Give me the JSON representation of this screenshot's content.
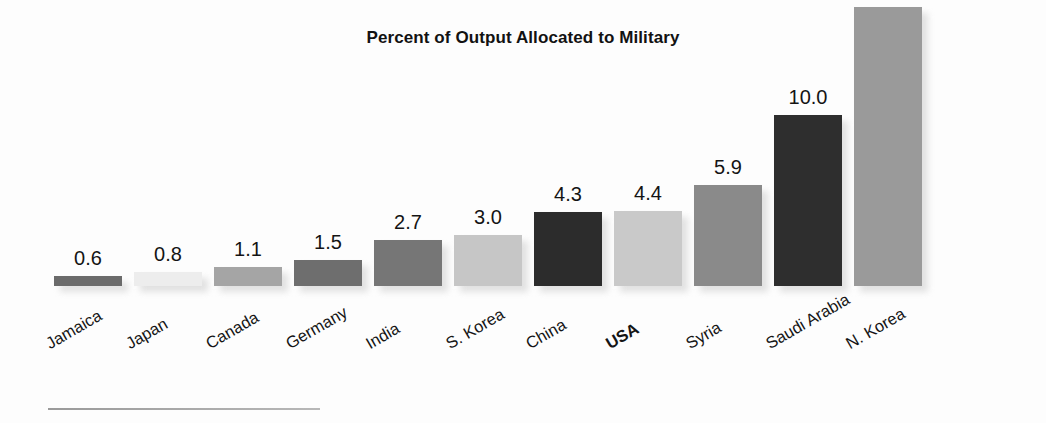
{
  "chart_data": {
    "type": "bar",
    "title": "Percent of Output Allocated to Military",
    "xlabel": "",
    "ylabel": "",
    "ylim": [
      0,
      17.5
    ],
    "grid": false,
    "legend": null,
    "categories": [
      "Jamaica",
      "Japan",
      "Canada",
      "Germany",
      "India",
      "S. Korea",
      "China",
      "USA",
      "Syria",
      "Saudi Arabia",
      "N. Korea"
    ],
    "values": [
      0.6,
      0.8,
      1.1,
      1.5,
      2.7,
      3.0,
      4.3,
      4.4,
      5.9,
      10.0,
      16.3
    ],
    "value_labels": [
      "0.6",
      "0.8",
      "1.1",
      "1.5",
      "2.7",
      "3.0",
      "4.3",
      "4.4",
      "5.9",
      "10.0",
      "16.3"
    ],
    "bar_colors": [
      "#6b6b6b",
      "#ededed",
      "#a5a5a5",
      "#6e6e6e",
      "#767676",
      "#c6c6c6",
      "#2c2c2c",
      "#c9c9c9",
      "#8a8a8a",
      "#2e2e2e",
      "#9a9a9a"
    ],
    "highlighted_category": "USA",
    "bars": [
      {
        "label": "Jamaica",
        "value": 0.6,
        "value_label": "0.6",
        "color": "#6b6b6b",
        "bold": false
      },
      {
        "label": "Japan",
        "value": 0.8,
        "value_label": "0.8",
        "color": "#ededed",
        "bold": false
      },
      {
        "label": "Canada",
        "value": 1.1,
        "value_label": "1.1",
        "color": "#a5a5a5",
        "bold": false
      },
      {
        "label": "Germany",
        "value": 1.5,
        "value_label": "1.5",
        "color": "#6e6e6e",
        "bold": false
      },
      {
        "label": "India",
        "value": 2.7,
        "value_label": "2.7",
        "color": "#767676",
        "bold": false
      },
      {
        "label": "S. Korea",
        "value": 3.0,
        "value_label": "3.0",
        "color": "#c6c6c6",
        "bold": false
      },
      {
        "label": "China",
        "value": 4.3,
        "value_label": "4.3",
        "color": "#2c2c2c",
        "bold": false
      },
      {
        "label": "USA",
        "value": 4.4,
        "value_label": "4.4",
        "color": "#c9c9c9",
        "bold": true
      },
      {
        "label": "Syria",
        "value": 5.9,
        "value_label": "5.9",
        "color": "#8a8a8a",
        "bold": false
      },
      {
        "label": "Saudi Arabia",
        "value": 10.0,
        "value_label": "10.0",
        "color": "#2e2e2e",
        "bold": false
      },
      {
        "label": "N. Korea",
        "value": 16.3,
        "value_label": "16.3",
        "color": "#9a9a9a",
        "bold": false
      }
    ]
  }
}
